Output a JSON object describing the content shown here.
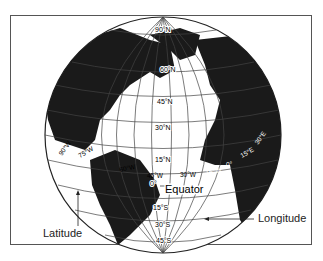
{
  "diagram": {
    "callouts": {
      "equator": "Equator",
      "latitude": "Latitude",
      "longitude": "Longitude"
    },
    "latitude_labels": [
      "90°N",
      "60°N",
      "45°N",
      "30°N",
      "15°N",
      "0°",
      "15°S",
      "30°S",
      "45°S"
    ],
    "longitude_labels": [
      "90°W",
      "75°W",
      "60°W",
      "45°W",
      "30°W",
      "15°W",
      "0°",
      "15°E",
      "30°E"
    ],
    "colors": {
      "land": "#1a1a1a",
      "ocean": "#ffffff",
      "grid": "#444444",
      "frame": "#555555"
    }
  }
}
